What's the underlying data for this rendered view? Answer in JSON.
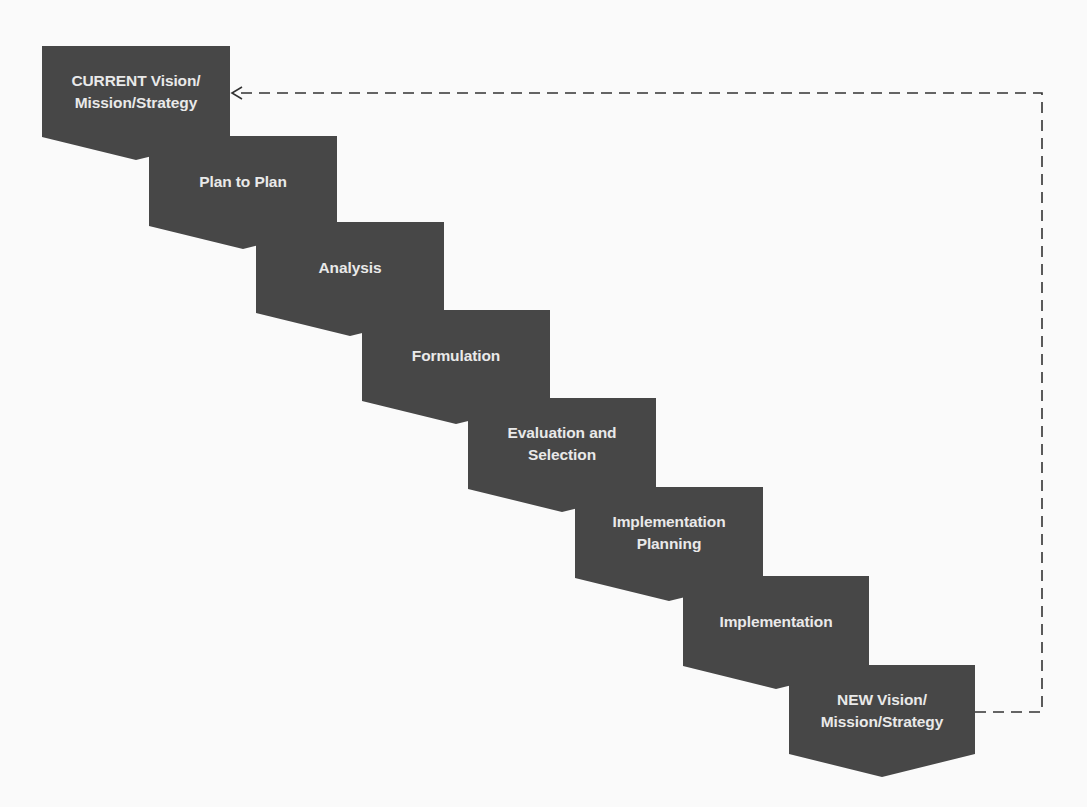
{
  "diagram": {
    "title": "",
    "colors": {
      "shape_fill": "#474747",
      "shape_text": "#e9e9e9",
      "connector": "#333333",
      "background": "#fafafa"
    },
    "steps": [
      {
        "label": "CURRENT Vision/\nMission/Strategy"
      },
      {
        "label": "Plan to Plan"
      },
      {
        "label": "Analysis"
      },
      {
        "label": "Formulation"
      },
      {
        "label": "Evaluation and\nSelection"
      },
      {
        "label": "Implementation\nPlanning"
      },
      {
        "label": "Implementation"
      },
      {
        "label": "NEW Vision/\nMission/Strategy"
      }
    ],
    "feedback_loop": {
      "style": "dashed",
      "from": "NEW Vision/Mission/Strategy",
      "to": "CURRENT Vision/Mission/Strategy",
      "arrowhead": "open-chevron"
    }
  }
}
